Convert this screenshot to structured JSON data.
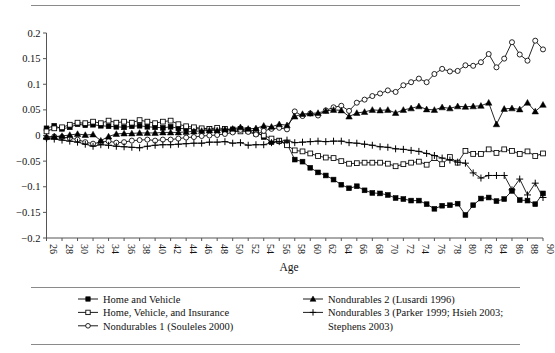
{
  "figure": {
    "x_axis_title": "Age",
    "rules": [
      "top-rule",
      "legend-separator-rule",
      "bottom-rule"
    ]
  },
  "chart_data": {
    "type": "line",
    "title": "",
    "xlabel": "Age",
    "ylabel": "",
    "xlim": [
      26,
      90
    ],
    "ylim": [
      -0.2,
      0.2
    ],
    "y_ticks": [
      0.2,
      0.15,
      0.1,
      0.05,
      0,
      -0.05,
      -0.1,
      -0.15,
      -0.2
    ],
    "y_tick_labels": [
      "0.2",
      "0.15",
      "0.1",
      "0.05",
      "0",
      "−0.05",
      "−0.1",
      "−0.15",
      "−0.2"
    ],
    "x_ticks": [
      26,
      28,
      30,
      32,
      34,
      36,
      38,
      40,
      42,
      44,
      46,
      48,
      50,
      52,
      54,
      56,
      58,
      60,
      62,
      64,
      66,
      68,
      70,
      72,
      74,
      76,
      78,
      80,
      82,
      84,
      86,
      88,
      90
    ],
    "x_tick_labels": [
      "26",
      "28",
      "30",
      "32",
      "34",
      "36",
      "38",
      "40",
      "42",
      "44",
      "46",
      "48",
      "50",
      "52",
      "54",
      "56",
      "58",
      "60",
      "62",
      "64",
      "66",
      "68",
      "70",
      "72",
      "74",
      "76",
      "78",
      "80",
      "82",
      "84",
      "86",
      "88",
      "90"
    ],
    "x_tick_rotation": 90,
    "grid": false,
    "legend_position": "bottom",
    "x": [
      26,
      27,
      28,
      29,
      30,
      31,
      32,
      33,
      34,
      35,
      36,
      37,
      38,
      39,
      40,
      41,
      42,
      43,
      44,
      45,
      46,
      47,
      48,
      49,
      50,
      51,
      52,
      53,
      54,
      55,
      56,
      57,
      58,
      59,
      60,
      61,
      62,
      63,
      64,
      65,
      66,
      67,
      68,
      69,
      70,
      71,
      72,
      73,
      74,
      75,
      76,
      77,
      78,
      79,
      80,
      81,
      82,
      83,
      84,
      85,
      86,
      87,
      88,
      89,
      90
    ],
    "series": [
      {
        "name": "Home and Vehicle",
        "marker": "filled-square",
        "values": [
          0.014,
          0.019,
          0.013,
          0.016,
          0.022,
          0.02,
          0.021,
          0.019,
          0.018,
          0.017,
          0.016,
          0.018,
          0.019,
          0.017,
          0.016,
          0.015,
          0.017,
          0.014,
          0.013,
          0.014,
          0.012,
          0.013,
          0.011,
          0.01,
          0.012,
          0.013,
          0.011,
          0.009,
          -0.003,
          -0.013,
          -0.011,
          -0.016,
          -0.047,
          -0.051,
          -0.063,
          -0.072,
          -0.078,
          -0.086,
          -0.096,
          -0.103,
          -0.099,
          -0.107,
          -0.112,
          -0.113,
          -0.116,
          -0.122,
          -0.124,
          -0.127,
          -0.127,
          -0.134,
          -0.143,
          -0.137,
          -0.136,
          -0.133,
          -0.155,
          -0.136,
          -0.123,
          -0.121,
          -0.128,
          -0.124,
          -0.108,
          -0.126,
          -0.127,
          -0.134,
          -0.113
        ]
      },
      {
        "name": "Home, Vehicle, and Insurance",
        "marker": "open-square",
        "values": [
          0.008,
          0.014,
          0.016,
          0.021,
          0.025,
          0.024,
          0.027,
          0.024,
          0.029,
          0.025,
          0.027,
          0.025,
          0.03,
          0.027,
          0.024,
          0.027,
          0.029,
          0.022,
          0.018,
          0.016,
          0.014,
          0.013,
          0.015,
          0.013,
          0.009,
          0.008,
          0.009,
          0.004,
          0.0,
          -0.006,
          -0.01,
          -0.019,
          -0.029,
          -0.031,
          -0.035,
          -0.04,
          -0.043,
          -0.044,
          -0.05,
          -0.055,
          -0.054,
          -0.053,
          -0.053,
          -0.053,
          -0.055,
          -0.06,
          -0.056,
          -0.053,
          -0.051,
          -0.057,
          -0.044,
          -0.056,
          -0.042,
          -0.053,
          -0.03,
          -0.036,
          -0.036,
          -0.027,
          -0.034,
          -0.027,
          -0.03,
          -0.036,
          -0.031,
          -0.04,
          -0.035
        ]
      },
      {
        "name": "Nondurables 1 (Souleles 2000)",
        "marker": "open-circle",
        "values": [
          -0.004,
          -0.002,
          -0.003,
          -0.005,
          -0.008,
          -0.013,
          -0.016,
          -0.013,
          -0.011,
          -0.014,
          -0.013,
          -0.01,
          -0.009,
          -0.008,
          -0.01,
          -0.008,
          -0.008,
          -0.006,
          -0.004,
          -0.003,
          -0.001,
          0.0,
          0.001,
          0.003,
          0.006,
          0.011,
          0.007,
          0.002,
          0.009,
          0.013,
          0.015,
          0.012,
          0.047,
          0.038,
          0.043,
          0.039,
          0.049,
          0.055,
          0.058,
          0.048,
          0.064,
          0.07,
          0.077,
          0.082,
          0.088,
          0.085,
          0.098,
          0.104,
          0.111,
          0.104,
          0.12,
          0.13,
          0.125,
          0.126,
          0.137,
          0.136,
          0.143,
          0.159,
          0.133,
          0.15,
          0.182,
          0.158,
          0.146,
          0.185,
          0.168
        ]
      },
      {
        "name": "Nondurables 2 (Lusardi 1996)",
        "marker": "filled-triangle",
        "values": [
          -0.003,
          -0.002,
          -0.001,
          0.001,
          0.003,
          0.001,
          0.002,
          -0.01,
          -0.002,
          0.003,
          0.004,
          0.004,
          0.005,
          0.005,
          0.005,
          0.006,
          0.006,
          0.006,
          0.007,
          0.008,
          0.009,
          0.01,
          0.01,
          0.012,
          0.013,
          0.016,
          0.013,
          0.014,
          0.019,
          0.017,
          0.022,
          0.02,
          0.037,
          0.042,
          0.043,
          0.044,
          0.048,
          0.05,
          0.049,
          0.037,
          0.044,
          0.046,
          0.05,
          0.049,
          0.05,
          0.044,
          0.05,
          0.053,
          0.057,
          0.051,
          0.05,
          0.055,
          0.053,
          0.057,
          0.056,
          0.057,
          0.058,
          0.064,
          0.022,
          0.052,
          0.053,
          0.051,
          0.064,
          0.047,
          0.06
        ]
      },
      {
        "name": "Nondurables 3 (Parker 1999; Hsieh 2003; Stephens 2003)",
        "marker": "plus",
        "values": [
          -0.006,
          -0.007,
          -0.009,
          -0.011,
          -0.013,
          -0.017,
          -0.021,
          -0.018,
          -0.019,
          -0.021,
          -0.022,
          -0.023,
          -0.024,
          -0.021,
          -0.019,
          -0.018,
          -0.018,
          -0.017,
          -0.016,
          -0.015,
          -0.015,
          -0.013,
          -0.013,
          -0.012,
          -0.015,
          -0.014,
          -0.019,
          -0.018,
          -0.018,
          -0.014,
          -0.012,
          -0.009,
          -0.014,
          -0.013,
          -0.012,
          -0.011,
          -0.012,
          -0.011,
          -0.011,
          -0.014,
          -0.015,
          -0.017,
          -0.019,
          -0.022,
          -0.023,
          -0.026,
          -0.027,
          -0.029,
          -0.031,
          -0.035,
          -0.039,
          -0.044,
          -0.048,
          -0.052,
          -0.054,
          -0.073,
          -0.083,
          -0.078,
          -0.078,
          -0.078,
          -0.106,
          -0.085,
          -0.116,
          -0.093,
          -0.121
        ]
      }
    ]
  },
  "legend": {
    "entries": [
      {
        "label": "Home and Vehicle",
        "marker": "filled-square",
        "column": 1
      },
      {
        "label": "Home, Vehicle, and Insurance",
        "marker": "open-square",
        "column": 1
      },
      {
        "label": "Nondurables 1 (Souleles 2000)",
        "marker": "open-circle",
        "column": 1
      },
      {
        "label": "Nondurables 2 (Lusardi 1996)",
        "marker": "filled-triangle",
        "column": 2
      },
      {
        "label": "Nondurables 3 (Parker 1999; Hsieh 2003;",
        "marker": "plus",
        "column": 2
      },
      {
        "label": "Stephens 2003)",
        "marker": "none",
        "column": 2
      }
    ]
  }
}
